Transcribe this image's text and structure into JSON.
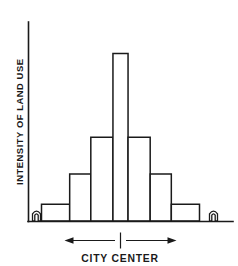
{
  "figure": {
    "background_color": "#ffffff",
    "ink_color": "#1a1a1a",
    "y_axis_label": "INTENSITY OF LAND USE",
    "x_axis_label": "CITY CENTER",
    "left_marker_icon": "house-icon",
    "right_marker_icon": "house-icon",
    "left_arrow_icon": "arrow-left-icon",
    "right_arrow_icon": "arrow-right-icon",
    "center_tick_name": "city-center-tick"
  },
  "chart_data": {
    "type": "bar",
    "title": "",
    "subtitle": "",
    "xlabel": "CITY CENTER",
    "ylabel": "INTENSITY OF LAND USE",
    "grid": false,
    "legend": false,
    "axis_ticks_shown": false,
    "xlim": [
      0,
      9
    ],
    "ylim": [
      0,
      100
    ],
    "categories": [
      "1",
      "2",
      "3",
      "4",
      "5",
      "6",
      "7"
    ],
    "values": [
      10,
      28,
      50,
      100,
      50,
      28,
      10
    ],
    "bar_edge_color": "#1a1a1a",
    "bar_fill_color": "#ffffff",
    "annotations": [
      {
        "name": "left-house-marker",
        "text": "",
        "icon": "house-icon",
        "position": "axis-left-end"
      },
      {
        "name": "right-house-marker",
        "text": "",
        "icon": "house-icon",
        "position": "axis-right-end"
      },
      {
        "name": "city-center-span-arrow",
        "text": "CITY CENTER",
        "icon": "double-arrow-icon",
        "position": "below-axis"
      }
    ]
  }
}
